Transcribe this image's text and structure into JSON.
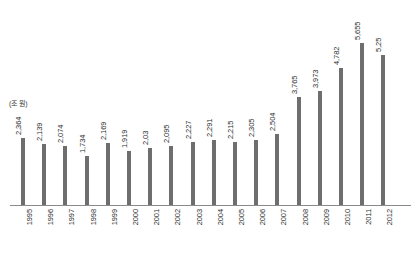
{
  "chart_data": {
    "type": "bar",
    "title": "",
    "subtitle": "",
    "xlabel": "",
    "ylabel": "",
    "unit_label": "(조 원)",
    "grid": false,
    "legend": false,
    "ylim": [
      0,
      5655
    ],
    "categories": [
      "1995",
      "1996",
      "1997",
      "1998",
      "1999",
      "2000",
      "2001",
      "2002",
      "2003",
      "2004",
      "2005",
      "2006",
      "2007",
      "2008",
      "2009",
      "2010",
      "2011",
      "2012"
    ],
    "values": [
      2364,
      2139,
      2074,
      1734,
      2169,
      1919,
      2030,
      2095,
      2227,
      2291,
      2215,
      2305,
      2504,
      3765,
      3973,
      4782,
      5655,
      5250
    ],
    "value_labels": [
      "2,364",
      "2,139",
      "2,074",
      "1,734",
      "2,169",
      "1,919",
      "2,03",
      "2,095",
      "2,227",
      "2,291",
      "2,215",
      "2,305",
      "2,504",
      "3,765",
      "3,973",
      "4,782",
      "5,655",
      "5,25"
    ],
    "colors": {
      "bar": "#6e6e6e",
      "axis": "#8a8a8a",
      "text": "#2e2e2e",
      "background": "#ffffff"
    }
  }
}
